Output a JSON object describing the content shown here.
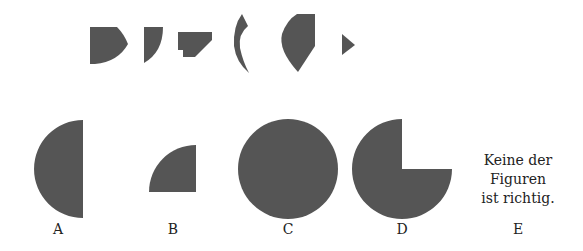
{
  "colors": {
    "shape_fill": "#555555",
    "background": "#ffffff",
    "text": "#222222"
  },
  "pieces": [
    {
      "id": "piece-1",
      "description": "flat-left shape with pointed curved right edge"
    },
    {
      "id": "piece-2",
      "description": "narrow shape with curved right edge"
    },
    {
      "id": "piece-3",
      "description": "notched trapezoid"
    },
    {
      "id": "piece-4",
      "description": "thin crescent sliver"
    },
    {
      "id": "piece-5",
      "description": "curved wedge with flat right edge"
    },
    {
      "id": "piece-6",
      "description": "small right-pointing triangle"
    }
  ],
  "options": [
    {
      "letter": "A",
      "shape": "left semicircle"
    },
    {
      "letter": "B",
      "shape": "quarter circle"
    },
    {
      "letter": "C",
      "shape": "full circle"
    },
    {
      "letter": "D",
      "shape": "three-quarter circle (top-right missing)"
    },
    {
      "letter": "E",
      "text_lines": [
        "Keine der",
        "Figuren",
        "ist richtig."
      ]
    }
  ]
}
